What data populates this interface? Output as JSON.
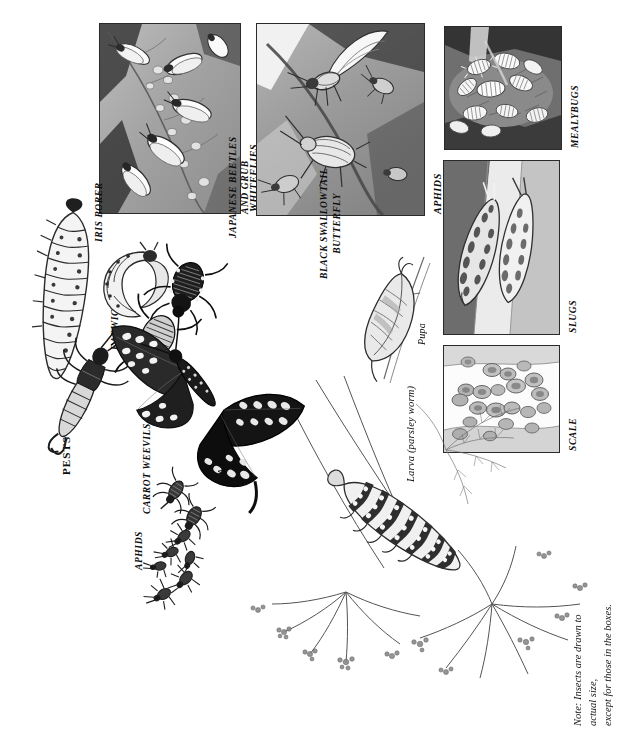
{
  "page": {
    "title": "PESTS",
    "note": "Note: Insects are drawn to actual size,\nexcept for those in the boxes.",
    "orientation": "rotated-90-ccw",
    "background": "#ffffff",
    "ink": "#141414"
  },
  "section_heading": {
    "label": "PESTS"
  },
  "boxed_plates": [
    {
      "id": "whiteflies",
      "label": "WHITEFLIES",
      "subject": "whiteflies-on-leaf-underside",
      "frame": {
        "x": 99,
        "y": 23,
        "w": 140,
        "h": 189
      },
      "tone_dark": "#4a4a4a",
      "tone_mid": "#9a9a9a",
      "tone_light": "#d8d8d8"
    },
    {
      "id": "aphids",
      "label": "APHIDS",
      "subject": "winged-and-wingless-aphids-on-stem",
      "frame": {
        "x": 256,
        "y": 23,
        "w": 167,
        "h": 191
      },
      "tone_dark": "#555555",
      "tone_mid": "#9e9e9e",
      "tone_light": "#dcdcdc"
    },
    {
      "id": "mealybugs",
      "label": "MEALYBUGS",
      "subject": "mealybug-colony-in-leaf-axil",
      "frame": {
        "x": 444,
        "y": 26,
        "w": 116,
        "h": 122
      },
      "tone_dark": "#3d3d3d",
      "tone_mid": "#8e8e8e",
      "tone_light": "#e2e2e2"
    },
    {
      "id": "slugs",
      "label": "SLUGS",
      "subject": "two-spotted-slugs-on-stem",
      "frame": {
        "x": 443,
        "y": 160,
        "w": 115,
        "h": 173
      },
      "tone_dark": "#4b4b4b",
      "tone_mid": "#a2a2a2",
      "tone_light": "#e6e6e6"
    },
    {
      "id": "scale",
      "label": "SCALE",
      "subject": "scale-insects-on-stem",
      "frame": {
        "x": 443,
        "y": 345,
        "w": 115,
        "h": 106
      },
      "tone_dark": "#7d7d7d",
      "tone_mid": "#b6b6b6",
      "tone_light": "#f1f1f1"
    }
  ],
  "specimens": [
    {
      "id": "iris-borer",
      "label": "IRIS BORER",
      "style": "caps",
      "subject": "iris-borer-caterpillar"
    },
    {
      "id": "earwig",
      "label": "EARWIG",
      "style": "caps",
      "subject": "earwig-with-forceps"
    },
    {
      "id": "japanese",
      "label": "JAPANESE BEETLES\nAND GRUB",
      "style": "caps",
      "subject": "japanese-beetles-and-white-grub"
    },
    {
      "id": "carrot-weevils",
      "label": "CARROT WEEVILS",
      "style": "caps",
      "subject": "carrot-weevil-pair"
    },
    {
      "id": "aphids-free",
      "label": "APHIDS",
      "style": "caps",
      "subject": "aphid-cluster-actual-size"
    }
  ],
  "life_cycle": {
    "title": "BLACK SWALLOWTAIL\nBUTTERFLY",
    "stages": [
      {
        "id": "adult",
        "label": "Adult",
        "subject": "black-swallowtail-adult-butterfly"
      },
      {
        "id": "pupa",
        "label": "Pupa",
        "subject": "chrysalis-on-stem"
      },
      {
        "id": "larva",
        "label": "Larva (parsley worm)",
        "subject": "parsley-worm-caterpillar-on-dill"
      }
    ],
    "host_plant": "dill-umbel-foliage"
  }
}
